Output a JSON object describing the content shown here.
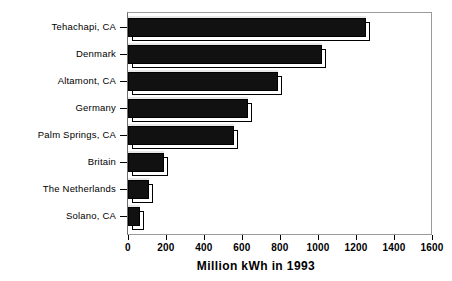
{
  "chart_data": {
    "type": "bar",
    "orientation": "horizontal",
    "title": "",
    "xlabel": "Million kWh in 1993",
    "ylabel": "",
    "categories": [
      "Tehachapi, CA",
      "Denmark",
      "Altamont, CA",
      "Germany",
      "Palm Springs, CA",
      "Britain",
      "The Netherlands",
      "Solano, CA"
    ],
    "values": [
      1250,
      1020,
      790,
      630,
      560,
      190,
      110,
      65
    ],
    "xlim": [
      0,
      1600
    ],
    "xticks": [
      0,
      200,
      400,
      600,
      800,
      1000,
      1200,
      1400,
      1600
    ],
    "xtick_labels": [
      "0",
      "200",
      "400",
      "600",
      "800",
      "1000",
      "1200",
      "1400",
      "1600"
    ],
    "grid": false,
    "legend": false,
    "bar_color": "#111111",
    "bar_edge_color": "#000000",
    "frame_color": "#9a9a9a",
    "background": "#ffffff"
  }
}
